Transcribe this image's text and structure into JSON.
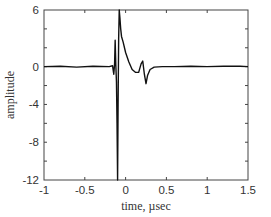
{
  "chart_data": {
    "type": "line",
    "title": "",
    "xlabel": "time, µsec",
    "ylabel": "amplitude",
    "xlim": [
      -1,
      1.5
    ],
    "ylim": [
      -12,
      6
    ],
    "x_ticks": [
      -1,
      -0.5,
      0,
      0.5,
      1,
      1.5
    ],
    "x_tick_labels": [
      "-1",
      "-0.5",
      "0",
      "0.5",
      "1",
      "1.5"
    ],
    "y_ticks_labeled": [
      6,
      0,
      -4,
      -8,
      -12
    ],
    "y_tick_labels": [
      "6",
      "0",
      "-4",
      "-8",
      "-12"
    ],
    "y_minor_ticks": [
      6,
      4,
      2,
      0,
      -2,
      -4,
      -6,
      -8,
      -10,
      -12
    ],
    "grid": false,
    "legend": null,
    "series": [
      {
        "name": "waveform",
        "color": "#111111",
        "x": [
          -1.0,
          -0.8,
          -0.6,
          -0.4,
          -0.2,
          -0.16,
          -0.145,
          -0.135,
          -0.128,
          -0.12,
          -0.112,
          -0.105,
          -0.098,
          -0.092,
          -0.085,
          -0.078,
          -0.07,
          -0.06,
          -0.05,
          -0.03,
          0.0,
          0.04,
          0.08,
          0.12,
          0.16,
          0.19,
          0.21,
          0.23,
          0.25,
          0.27,
          0.3,
          0.35,
          0.45,
          0.6,
          0.8,
          1.0,
          1.2,
          1.4,
          1.5
        ],
        "y": [
          0.0,
          0.05,
          -0.05,
          0.05,
          0.0,
          0.1,
          -0.8,
          0.3,
          2.8,
          0.2,
          -1.6,
          -6.0,
          -12.0,
          -4.0,
          3.0,
          6.0,
          5.2,
          4.0,
          3.2,
          2.6,
          1.5,
          0.5,
          -0.3,
          -0.6,
          -0.6,
          0.3,
          0.6,
          -0.8,
          -1.8,
          -0.9,
          -0.3,
          -0.05,
          0.0,
          0.0,
          0.05,
          0.0,
          0.05,
          0.05,
          0.0
        ]
      }
    ]
  }
}
